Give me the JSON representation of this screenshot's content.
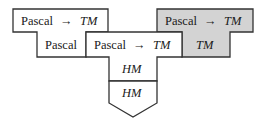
{
  "diagram": {
    "type": "t-diagram-bootstrapping",
    "colors": {
      "stroke": "#333333",
      "fill_white": "#ffffff",
      "fill_gray": "#d3d3d3",
      "text": "#1a1a1a"
    },
    "left_compiler": {
      "top_label_source": "Pascal",
      "top_label_arrow": "→",
      "top_label_target": "TM",
      "bottom_label": "Pascal"
    },
    "middle_compiler": {
      "top_label_source": "Pascal",
      "top_label_arrow": "→",
      "top_label_target": "TM",
      "bottom_label": "HM"
    },
    "machine": {
      "label": "HM"
    },
    "right_compiler": {
      "top_label_source": "Pascal",
      "top_label_arrow": "→",
      "top_label_target": "TM",
      "bottom_label": "TM",
      "shaded": true
    }
  }
}
